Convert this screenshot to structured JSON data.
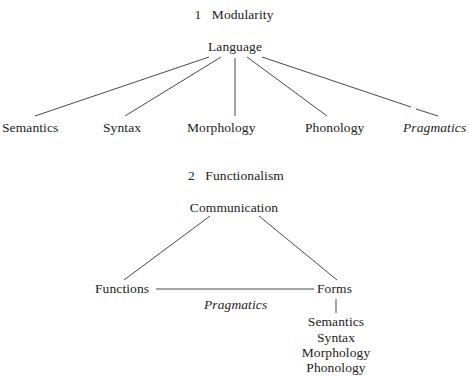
{
  "diagram1": {
    "number": "1",
    "title": "Modularity",
    "root": "Language",
    "children": [
      {
        "label": "Semantics",
        "italic": false
      },
      {
        "label": "Syntax",
        "italic": false
      },
      {
        "label": "Morphology",
        "italic": false
      },
      {
        "label": "Phonology",
        "italic": false
      },
      {
        "label": "Pragmatics",
        "italic": true
      }
    ]
  },
  "diagram2": {
    "number": "2",
    "title": "Functionalism",
    "root": "Communication",
    "left": "Functions",
    "right": "Forms",
    "link_label": "Pragmatics",
    "forms_components": [
      "Semantics",
      "Syntax",
      "Morphology",
      "Phonology"
    ]
  }
}
